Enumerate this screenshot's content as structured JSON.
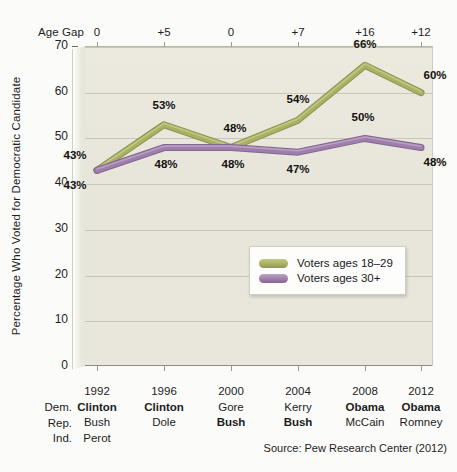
{
  "chart_data": {
    "type": "line",
    "title": "",
    "xlabel": "",
    "ylabel": "Percentage Who Voted for Democratic Candidate",
    "ylim": [
      0,
      70
    ],
    "yticks": [
      0,
      10,
      20,
      30,
      40,
      50,
      60,
      70
    ],
    "grid": true,
    "legend_position": "inside-right",
    "categories": [
      "1992",
      "1996",
      "2000",
      "2004",
      "2008",
      "2012"
    ],
    "series": [
      {
        "name": "Voters ages 18–29",
        "color": "#a9b162",
        "values": [
          43,
          53,
          48,
          54,
          66,
          60
        ],
        "labels": [
          "43%",
          "53%",
          "48%",
          "54%",
          "66%",
          "60%"
        ]
      },
      {
        "name": "Voters ages 30+",
        "color": "#9e7fab",
        "values": [
          43,
          48,
          48,
          47,
          50,
          48
        ],
        "labels": [
          "43%",
          "48%",
          "48%",
          "47%",
          "50%",
          "48%"
        ]
      }
    ],
    "annotations": {
      "age_gap_label": "Age Gap",
      "age_gap_values": [
        "0",
        "+5",
        "0",
        "+7",
        "+16",
        "+12"
      ]
    },
    "source": "Source: Pew Research Center (2012)"
  },
  "axis": {
    "row_labels": [
      "Dem.",
      "Rep.",
      "Ind."
    ],
    "columns": [
      {
        "year": "1992",
        "dem": "Clinton",
        "dem_bold": true,
        "rep": "Bush",
        "rep_bold": false,
        "ind": "Perot"
      },
      {
        "year": "1996",
        "dem": "Clinton",
        "dem_bold": true,
        "rep": "Dole",
        "rep_bold": false,
        "ind": ""
      },
      {
        "year": "2000",
        "dem": "Gore",
        "dem_bold": false,
        "rep": "Bush",
        "rep_bold": true,
        "ind": ""
      },
      {
        "year": "2004",
        "dem": "Kerry",
        "dem_bold": false,
        "rep": "Bush",
        "rep_bold": true,
        "ind": ""
      },
      {
        "year": "2008",
        "dem": "Obama",
        "dem_bold": true,
        "rep": "McCain",
        "rep_bold": false,
        "ind": ""
      },
      {
        "year": "2012",
        "dem": "Obama",
        "dem_bold": true,
        "rep": "Romney",
        "rep_bold": false,
        "ind": ""
      }
    ]
  },
  "colors": {
    "young": "#a9b162",
    "older": "#9e7fab",
    "plot_bg": "#e9e7db",
    "grid": "#c8c7b6",
    "page_bg": "#fbfbf9"
  }
}
